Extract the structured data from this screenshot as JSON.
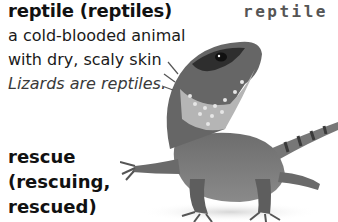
{
  "entries": [
    {
      "headword": "reptile (reptiles)",
      "definition_line1": "a cold-blooded animal",
      "definition_line2": "with dry, scaly skin",
      "example": "Lizards are reptiles."
    },
    {
      "headword_line1": "rescue",
      "headword_line2": "(rescuing,",
      "headword_line3": "rescued)"
    }
  ],
  "image": {
    "label": "reptile",
    "subject": "lizard-photo"
  }
}
